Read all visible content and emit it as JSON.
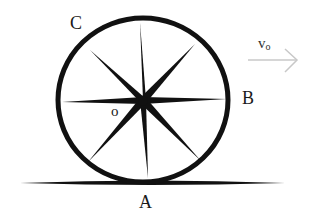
{
  "diagram": {
    "type": "rolling-wheel",
    "labels": {
      "top_left_point": "C",
      "right_point": "B",
      "center": "o",
      "contact_point": "A",
      "velocity": "v",
      "velocity_subscript": "o"
    },
    "colors": {
      "ink": "#111111",
      "arrow": "#c8c8c8",
      "background": "#ffffff"
    },
    "spoke_count": 8
  }
}
